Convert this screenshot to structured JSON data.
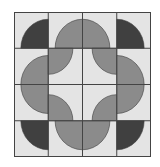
{
  "diagram": {
    "type": "quilt-block",
    "rows": 4,
    "cols": 4,
    "colors": {
      "background": "#e4e4e4",
      "dark": "#404040",
      "medium": "#8b8b8b",
      "grid": "#444444"
    },
    "cells": [
      [
        {
          "fill": "dark",
          "corner": "br",
          "r": 0.8
        },
        {
          "fill": "medium",
          "corner": "br",
          "r": 0.8
        },
        {
          "fill": "medium",
          "corner": "bl",
          "r": 0.8
        },
        {
          "fill": "dark",
          "corner": "bl",
          "r": 0.8
        }
      ],
      [
        {
          "fill": "medium",
          "corner": "br",
          "r": 0.8
        },
        {
          "fill": "medium",
          "corner": "tl",
          "r": 0.72
        },
        {
          "fill": "medium",
          "corner": "tr",
          "r": 0.72
        },
        {
          "fill": "medium",
          "corner": "bl",
          "r": 0.8
        }
      ],
      [
        {
          "fill": "medium",
          "corner": "tr",
          "r": 0.8
        },
        {
          "fill": "medium",
          "corner": "bl",
          "r": 0.72
        },
        {
          "fill": "medium",
          "corner": "br",
          "r": 0.72
        },
        {
          "fill": "medium",
          "corner": "tl",
          "r": 0.8
        }
      ],
      [
        {
          "fill": "dark",
          "corner": "tr",
          "r": 0.8
        },
        {
          "fill": "medium",
          "corner": "tr",
          "r": 0.8
        },
        {
          "fill": "medium",
          "corner": "tl",
          "r": 0.8
        },
        {
          "fill": "dark",
          "corner": "tl",
          "r": 0.8
        }
      ]
    ]
  }
}
